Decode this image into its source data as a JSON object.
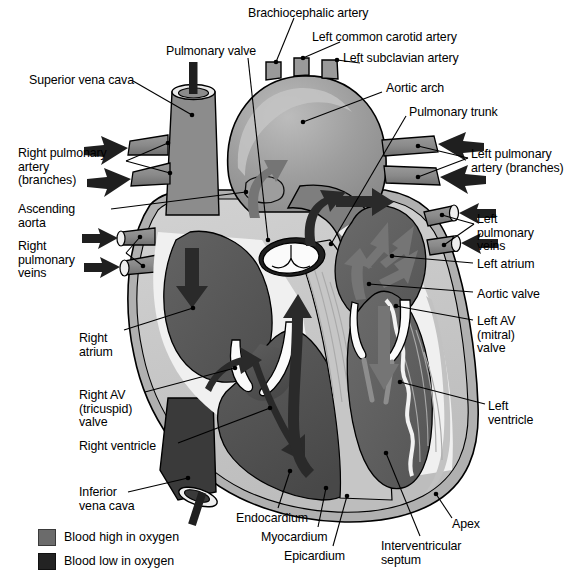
{
  "figure": {
    "background": "#ffffff"
  },
  "colors": {
    "oxygen_high": "#6b6b6b",
    "oxygen_low": "#232323",
    "myocardium": "#c9c9c9",
    "epicardium": "#b3b3b3",
    "endocardium": "#f2f2f2",
    "chamber_dark": "#575757",
    "vessel_gray": "#8a8a8a",
    "arch_gray": "#9a9a9a",
    "outline": "#000000",
    "leader": "#000000"
  },
  "labels": [
    {
      "id": "brachiocephalic-artery",
      "text": "Brachiocephalic artery",
      "align": "left",
      "x": 248,
      "y": 7,
      "lines": [
        "Brachiocephalic artery"
      ]
    },
    {
      "id": "left-common-carotid",
      "text": "Left common carotid artery",
      "align": "left",
      "x": 312,
      "y": 31,
      "lines": [
        "Left common carotid artery"
      ]
    },
    {
      "id": "left-subclavian-artery",
      "text": "Left subclavian artery",
      "align": "left",
      "x": 343,
      "y": 52,
      "lines": [
        "Left subclavian artery"
      ]
    },
    {
      "id": "pulmonary-valve",
      "text": "Pulmonary valve",
      "align": "left",
      "x": 166,
      "y": 45,
      "lines": [
        "Pulmonary valve"
      ]
    },
    {
      "id": "superior-vena-cava",
      "text": "Superior vena cava",
      "align": "left",
      "x": 29,
      "y": 74,
      "lines": [
        "Superior vena cava"
      ]
    },
    {
      "id": "aortic-arch",
      "text": "Aortic arch",
      "align": "left",
      "x": 386,
      "y": 82,
      "lines": [
        "Aortic arch"
      ]
    },
    {
      "id": "pulmonary-trunk",
      "text": "Pulmonary trunk",
      "align": "left",
      "x": 409,
      "y": 106,
      "lines": [
        "Pulmonary trunk"
      ]
    },
    {
      "id": "right-pulmonary-artery",
      "text": "Right pulmonary artery (branches)",
      "align": "left",
      "x": 18,
      "y": 147,
      "lines": [
        "Right pulmonary",
        "artery",
        "(branches)"
      ]
    },
    {
      "id": "left-pulmonary-artery",
      "text": "Left pulmonary artery (branches)",
      "align": "left",
      "x": 471,
      "y": 148,
      "lines": [
        "Left pulmonary",
        "artery (branches)"
      ]
    },
    {
      "id": "ascending-aorta",
      "text": "Ascending aorta",
      "align": "left",
      "x": 18,
      "y": 203,
      "lines": [
        "Ascending",
        "aorta"
      ]
    },
    {
      "id": "right-pulmonary-veins",
      "text": "Right pulmonary veins",
      "align": "left",
      "x": 18,
      "y": 240,
      "lines": [
        "Right",
        "pulmonary",
        "veins"
      ]
    },
    {
      "id": "left-pulmonary-veins",
      "text": "Left pulmonary veins",
      "align": "left",
      "x": 477,
      "y": 213,
      "lines": [
        "Left",
        "pulmonary",
        "veins"
      ]
    },
    {
      "id": "left-atrium",
      "text": "Left atrium",
      "align": "left",
      "x": 477,
      "y": 258,
      "lines": [
        "Left atrium"
      ]
    },
    {
      "id": "aortic-valve",
      "text": "Aortic valve",
      "align": "left",
      "x": 477,
      "y": 288,
      "lines": [
        "Aortic valve"
      ]
    },
    {
      "id": "left-av-mitral-valve",
      "text": "Left AV (mitral) valve",
      "align": "left",
      "x": 477,
      "y": 315,
      "lines": [
        "Left AV",
        "(mitral)",
        "valve"
      ]
    },
    {
      "id": "right-atrium",
      "text": "Right atrium",
      "align": "left",
      "x": 79,
      "y": 332,
      "lines": [
        "Right",
        "atrium"
      ]
    },
    {
      "id": "right-av-tricuspid-valve",
      "text": "Right AV (tricuspid) valve",
      "align": "left",
      "x": 79,
      "y": 389,
      "lines": [
        "Right AV",
        "(tricuspid)",
        "valve"
      ]
    },
    {
      "id": "right-ventricle",
      "text": "Right ventricle",
      "align": "left",
      "x": 79,
      "y": 440,
      "lines": [
        "Right ventricle"
      ]
    },
    {
      "id": "left-ventricle",
      "text": "Left ventricle",
      "align": "left",
      "x": 488,
      "y": 400,
      "lines": [
        "Left",
        "ventricle"
      ]
    },
    {
      "id": "inferior-vena-cava",
      "text": "Inferior vena cava",
      "align": "left",
      "x": 79,
      "y": 486,
      "lines": [
        "Inferior",
        "vena cava"
      ]
    },
    {
      "id": "endocardium",
      "text": "Endocardium",
      "align": "left",
      "x": 236,
      "y": 512,
      "lines": [
        "Endocardium"
      ]
    },
    {
      "id": "myocardium",
      "text": "Myocardium",
      "align": "left",
      "x": 261,
      "y": 531,
      "lines": [
        "Myocardium"
      ]
    },
    {
      "id": "epicardium",
      "text": "Epicardium",
      "align": "left",
      "x": 284,
      "y": 550,
      "lines": [
        "Epicardium"
      ]
    },
    {
      "id": "interventricular-septum",
      "text": "Interventricular septum",
      "align": "left",
      "x": 381,
      "y": 540,
      "lines": [
        "Interventricular",
        "septum"
      ]
    },
    {
      "id": "apex",
      "text": "Apex",
      "align": "left",
      "x": 452,
      "y": 518,
      "lines": [
        "Apex"
      ]
    }
  ],
  "legend": {
    "items": [
      {
        "id": "blood-high-oxygen",
        "label": "Blood high in oxygen",
        "swatch": "#6b6b6b",
        "x": 38,
        "y": 529,
        "text_x": 64,
        "text_y": 530
      },
      {
        "id": "blood-low-oxygen",
        "label": "Blood low in oxygen",
        "swatch": "#232323",
        "x": 38,
        "y": 553,
        "text_x": 64,
        "text_y": 554
      }
    ]
  },
  "structures": {
    "chambers": [
      "right atrium",
      "right ventricle",
      "left atrium",
      "left ventricle"
    ],
    "valves": [
      "pulmonary valve",
      "aortic valve",
      "right AV (tricuspid) valve",
      "left AV (mitral) valve"
    ],
    "great_vessels": [
      "superior vena cava",
      "inferior vena cava",
      "ascending aorta",
      "aortic arch",
      "pulmonary trunk",
      "pulmonary arteries",
      "pulmonary veins"
    ],
    "wall_layers": [
      "endocardium",
      "myocardium",
      "epicardium"
    ],
    "arch_branches": [
      "brachiocephalic artery",
      "left common carotid artery",
      "left subclavian artery"
    ]
  }
}
